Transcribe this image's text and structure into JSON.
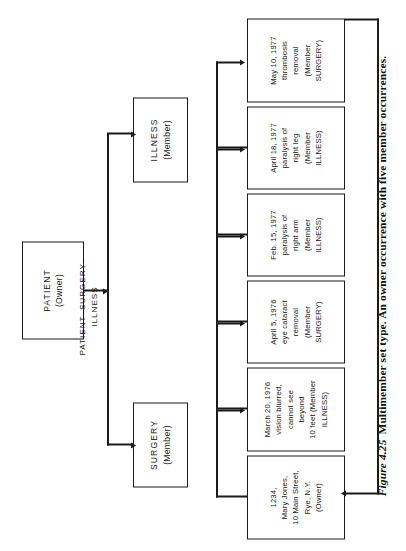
{
  "figure": {
    "number": "Figure 4.25",
    "caption": "Multimember set type. An owner occurrence with five member occurrences."
  },
  "schema": {
    "set_label_line1": "PATIENT–SURGERY–",
    "set_label_line2": "ILLNESS",
    "owner_box": {
      "name": "PATIENT",
      "role": "(Owner)"
    },
    "member_boxes": [
      {
        "name": "SURGERY",
        "role": "(Member)"
      },
      {
        "name": "ILLNESS",
        "role": "(Member)"
      }
    ]
  },
  "occurrences": [
    {
      "id": "owner-occurrence",
      "lines": [
        "1234,",
        "Mary Jones,",
        "10 Main Street,",
        "Rye, N.Y.",
        "(Owner)"
      ]
    },
    {
      "id": "member-occurrence-1",
      "lines": [
        "March 20, 1976",
        "vision blurred,",
        "cannot see",
        "beyond",
        "10 feet (Member",
        "ILLNESS)"
      ]
    },
    {
      "id": "member-occurrence-2",
      "lines": [
        "April 5, 1976",
        "eye cataract",
        "removal",
        "(Member",
        "SURGERY)"
      ]
    },
    {
      "id": "member-occurrence-3",
      "lines": [
        "Feb. 15, 1977",
        "paralysis of",
        "right arm",
        "(Member",
        "ILLNESS)"
      ]
    },
    {
      "id": "member-occurrence-4",
      "lines": [
        "April 18, 1977",
        "paralysis of",
        "right leg",
        "(Member",
        "ILLNESS)"
      ]
    },
    {
      "id": "member-occurrence-5",
      "lines": [
        "May 10, 1977",
        "thrombosis",
        "removal",
        "(Member",
        "SURGERY)"
      ]
    }
  ],
  "colors": {
    "ink": "#1b1b1b",
    "paper": "#ffffff"
  }
}
